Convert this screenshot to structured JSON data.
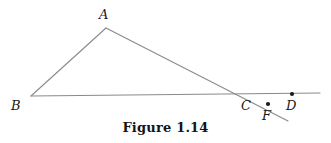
{
  "figure": {
    "caption": "Figure 1.14",
    "width": 331,
    "height": 143,
    "background_color": "#ffffff",
    "line_color": "#8a8a8a",
    "dot_color": "#1a1a1a",
    "label_color": "#1a1a1a",
    "stroke_width": 1.1
  },
  "points": [
    {
      "id": "A",
      "label": "A",
      "x": 106,
      "y": 28,
      "dot": false,
      "label_x": 99,
      "label_y": 8
    },
    {
      "id": "B",
      "label": "B",
      "x": 31,
      "y": 96,
      "dot": false,
      "label_x": 11,
      "label_y": 99
    },
    {
      "id": "C",
      "label": "C",
      "x": 247,
      "y": 96,
      "dot": false,
      "label_x": 241,
      "label_y": 99
    },
    {
      "id": "D",
      "label": "D",
      "x": 292,
      "y": 94,
      "dot": true,
      "label_x": 286,
      "label_y": 99
    },
    {
      "id": "F",
      "label": "F",
      "x": 268,
      "y": 104,
      "dot": true,
      "label_x": 262,
      "label_y": 109
    }
  ],
  "segments": [
    {
      "id": "BD",
      "name": "baseline-BD",
      "x1": 31,
      "y1": 96,
      "x2": 320,
      "y2": 93
    },
    {
      "id": "BA",
      "name": "segment-BA",
      "x1": 31,
      "y1": 96,
      "x2": 106,
      "y2": 28
    },
    {
      "id": "ACF",
      "name": "transversal-A-through-C",
      "x1": 106,
      "y1": 28,
      "x2": 288,
      "y2": 121
    }
  ],
  "dot_radius": 2.1
}
